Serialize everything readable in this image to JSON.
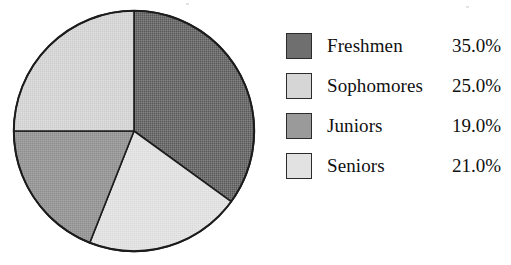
{
  "chart_data": {
    "type": "pie",
    "title": "",
    "subtitle": "",
    "xlabel": "",
    "ylabel": "",
    "legend_position": "right",
    "grid": false,
    "start_angle_deg": 0,
    "direction": "clockwise",
    "unit": "%",
    "categories": [
      "Freshmen",
      "Sophomores",
      "Juniors",
      "Seniors"
    ],
    "values": [
      35.0,
      25.0,
      19.0,
      21.0
    ],
    "value_labels": [
      "35.0%",
      "25.0%",
      "19.0%",
      "21.0%"
    ],
    "colors": [
      "#6f6f6f",
      "#d6d6d6",
      "#9a9a9a",
      "#e2e2e2"
    ],
    "slices": [
      {
        "label": "Freshmen",
        "value": 35.0,
        "value_label": "35.0%",
        "color": "#6f6f6f",
        "start_deg": 0.0,
        "end_deg": 126.0,
        "swatch_name": "freshmen"
      },
      {
        "label": "Seniors",
        "value": 21.0,
        "value_label": "21.0%",
        "color": "#e2e2e2",
        "start_deg": 126.0,
        "end_deg": 201.6,
        "swatch_name": "seniors"
      },
      {
        "label": "Juniors",
        "value": 19.0,
        "value_label": "19.0%",
        "color": "#9a9a9a",
        "start_deg": 201.6,
        "end_deg": 270.0,
        "swatch_name": "juniors"
      },
      {
        "label": "Sophomores",
        "value": 25.0,
        "value_label": "25.0%",
        "color": "#d6d6d6",
        "start_deg": 270.0,
        "end_deg": 360.0,
        "swatch_name": "sophomores"
      }
    ],
    "outline_color": "#1c1c1c"
  },
  "legend": {
    "rows": [
      {
        "label": "Freshmen",
        "value": "35.0%",
        "color": "#6f6f6f"
      },
      {
        "label": "Sophomores",
        "value": "25.0%",
        "color": "#d6d6d6"
      },
      {
        "label": "Juniors",
        "value": "19.0%",
        "color": "#9a9a9a"
      },
      {
        "label": "Seniors",
        "value": "21.0%",
        "color": "#e2e2e2"
      }
    ]
  }
}
